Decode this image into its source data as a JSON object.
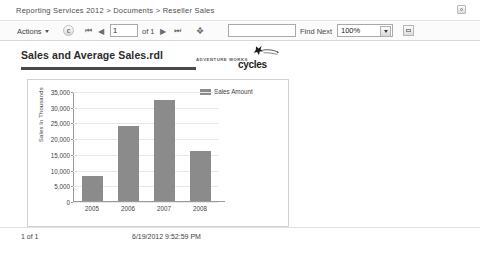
{
  "breadcrumb": {
    "text": "Reporting Services 2012 > Documents > Reseller Sales",
    "parts": [
      "Reporting Services 2012",
      "Documents",
      "Reseller Sales"
    ]
  },
  "header": {
    "help_icon": "help-icon"
  },
  "toolbar": {
    "actions_label": "Actions",
    "refresh_icon": "refresh-icon",
    "first_page_icon": "⏮",
    "prev_page_icon": "◀",
    "next_page_icon": "▶",
    "last_page_icon": "⏭",
    "export_icon": "❖",
    "page_number": "1",
    "of_label": "of 1",
    "find_value": "",
    "find_placeholder": "",
    "find_next_label": "Find Next",
    "zoom_value": "100%",
    "zoom_options": [
      "100%"
    ],
    "print_icon": "print-icon"
  },
  "report": {
    "title": "Sales and Average Sales.rdl",
    "logo": {
      "brand_top": "ADVENTURE WORKS",
      "brand_main": "cycles"
    }
  },
  "chart_data": {
    "type": "bar",
    "title": "",
    "categories": [
      "2005",
      "2006",
      "2007",
      "2008"
    ],
    "values": [
      8000,
      24000,
      32000,
      16000
    ],
    "series": [
      {
        "name": "Sales Amount",
        "values": [
          8000,
          24000,
          32000,
          16000
        ]
      }
    ],
    "xlabel": "",
    "ylabel": "Sales In Thousands",
    "ylim": [
      0,
      35000
    ],
    "yticks": [
      0,
      5000,
      10000,
      15000,
      20000,
      25000,
      30000,
      35000
    ],
    "ytick_labels": [
      "0",
      "5,000",
      "10,000",
      "15,000",
      "20,000",
      "25,000",
      "30,000",
      "35,000"
    ],
    "legend": [
      "Sales Amount"
    ],
    "legend_position": "top-right",
    "grid": true,
    "bar_color": "#8b8b8b"
  },
  "footer": {
    "page_indicator": "1 of 1",
    "timestamp": "6/19/2012 9:52:59 PM"
  }
}
